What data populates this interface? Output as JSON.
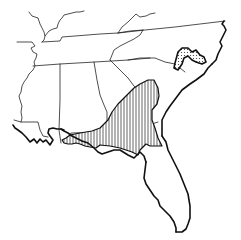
{
  "map": {
    "region": "Southeastern United States",
    "colors": {
      "background": "#ffffff",
      "lines": "#111111"
    },
    "legend_patterns": [
      {
        "name": "vertical-hatch",
        "description": "Range area A (Gulf/Atlantic coastal plain: Florida panhandle, south Georgia, coastal South Carolina)"
      },
      {
        "name": "stipple",
        "description": "Range area B (eastern North Carolina)"
      }
    ]
  }
}
